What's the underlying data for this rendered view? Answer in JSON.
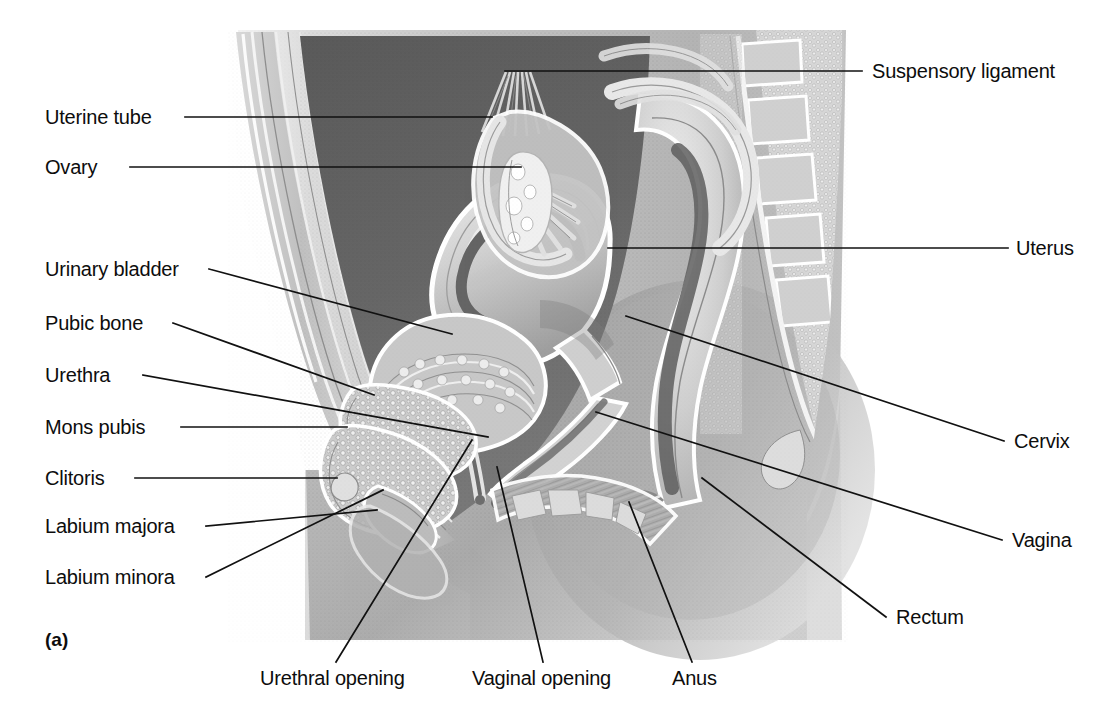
{
  "figure": {
    "panel_letter": "(a)",
    "caption_alt": "Sagittal section of the female pelvis showing the reproductive and urinary organs",
    "illustration_style": "grayscale halftone medical illustration",
    "colors": {
      "background": "#ffffff",
      "text": "#0d0d0d",
      "leader_line": "#111111",
      "body_light": "#c9c9c9",
      "body_mid": "#a8a8a8",
      "body_dark": "#6f6f6f",
      "cavity_dark": "#555555",
      "organ_light": "#e4e4e4",
      "bone_light": "#dcdcdc"
    }
  },
  "labels_left": [
    {
      "id": "uterine-tube",
      "text": "Uterine tube",
      "x": 45,
      "y": 117,
      "text_end_x": 175,
      "line_to_x": 492,
      "line_to_y": 117
    },
    {
      "id": "ovary",
      "text": "Ovary",
      "x": 45,
      "y": 167,
      "text_end_x": 120,
      "line_to_x": 521,
      "line_to_y": 167
    },
    {
      "id": "urinary-bladder",
      "text": "Urinary bladder",
      "x": 45,
      "y": 269,
      "text_end_x": 199,
      "line_to_x": 452,
      "line_to_y": 334
    },
    {
      "id": "pubic-bone",
      "text": "Pubic bone",
      "x": 45,
      "y": 323,
      "text_end_x": 163,
      "line_to_x": 374,
      "line_to_y": 395
    },
    {
      "id": "urethra",
      "text": "Urethra",
      "x": 45,
      "y": 375,
      "text_end_x": 133,
      "line_to_x": 488,
      "line_to_y": 437
    },
    {
      "id": "mons-pubis",
      "text": "Mons pubis",
      "x": 45,
      "y": 427,
      "text_end_x": 171,
      "line_to_x": 347,
      "line_to_y": 427
    },
    {
      "id": "clitoris",
      "text": "Clitoris",
      "x": 45,
      "y": 478,
      "text_end_x": 125,
      "line_to_x": 337,
      "line_to_y": 478
    },
    {
      "id": "labium-majora",
      "text": "Labium majora",
      "x": 45,
      "y": 526,
      "text_end_x": 196,
      "line_to_x": 377,
      "line_to_y": 510
    },
    {
      "id": "labium-minora",
      "text": "Labium minora",
      "x": 45,
      "y": 577,
      "text_end_x": 196,
      "line_to_x": 383,
      "line_to_y": 490
    }
  ],
  "labels_right": [
    {
      "id": "suspensory-ligament",
      "text": "Suspensory ligament",
      "x": 872,
      "y": 71,
      "line_from_x": 862,
      "line_to_x": 505,
      "line_to_y": 71
    },
    {
      "id": "uterus",
      "text": "Uterus",
      "x": 1016,
      "y": 248,
      "line_from_x": 1008,
      "line_to_x": 608,
      "line_to_y": 248
    },
    {
      "id": "cervix",
      "text": "Cervix",
      "x": 1014,
      "y": 441,
      "line_from_x": 1004,
      "line_to_x": 626,
      "line_to_y": 316
    },
    {
      "id": "vagina",
      "text": "Vagina",
      "x": 1012,
      "y": 540,
      "line_from_x": 1002,
      "line_to_x": 596,
      "line_to_y": 412
    },
    {
      "id": "rectum",
      "text": "Rectum",
      "x": 896,
      "y": 617,
      "line_from_x": 886,
      "line_to_x": 702,
      "line_to_y": 478
    }
  ],
  "labels_bottom": [
    {
      "id": "urethral-opening",
      "text": "Urethral opening",
      "x": 260,
      "y": 678,
      "line_from_x": 336,
      "line_from_y": 662,
      "line_to_x": 472,
      "line_to_y": 440
    },
    {
      "id": "vaginal-opening",
      "text": "Vaginal opening",
      "x": 472,
      "y": 678,
      "line_from_x": 543,
      "line_from_y": 662,
      "line_to_x": 497,
      "line_to_y": 467
    },
    {
      "id": "anus",
      "text": "Anus",
      "x": 672,
      "y": 678,
      "line_from_x": 692,
      "line_from_y": 662,
      "line_to_x": 629,
      "line_to_y": 502
    }
  ]
}
